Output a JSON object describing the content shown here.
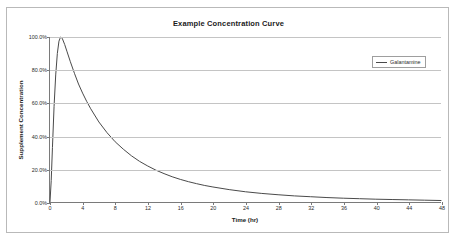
{
  "chart_data": {
    "type": "line",
    "title": "Example Concentration Curve",
    "xlabel": "Time (hr)",
    "ylabel": "Supplement Concentration",
    "xlim": [
      0,
      48
    ],
    "ylim": [
      0,
      100
    ],
    "grid": true,
    "legend_position": "upper-right-inside",
    "x_ticks": [
      0,
      4,
      8,
      12,
      16,
      20,
      24,
      28,
      32,
      36,
      40,
      44,
      48
    ],
    "x_tick_labels": [
      "0",
      "4",
      "8",
      "12",
      "16",
      "20",
      "24",
      "28",
      "32",
      "36",
      "40",
      "44",
      "48"
    ],
    "y_ticks": [
      0,
      20,
      40,
      60,
      80,
      100
    ],
    "y_tick_labels": [
      "0.0%",
      "20.0%",
      "40.0%",
      "60.0%",
      "80.0%",
      "100.0%"
    ],
    "series": [
      {
        "name": "Galantamine",
        "color": "#4a4a4a",
        "x": [
          0,
          0.15,
          0.3,
          0.5,
          0.7,
          0.9,
          1.1,
          1.3,
          1.5,
          1.8,
          2.1,
          2.5,
          3,
          3.5,
          4,
          4.5,
          5,
          6,
          7,
          8,
          9,
          10,
          11,
          12,
          13,
          14,
          15,
          16,
          17,
          18,
          19,
          20,
          22,
          24,
          26,
          28,
          30,
          32,
          34,
          36,
          38,
          40,
          42,
          44,
          46,
          48
        ],
        "y": [
          0,
          13,
          33,
          58,
          77,
          90,
          97.5,
          100,
          99.2,
          95.5,
          91,
          85,
          78,
          71.5,
          66,
          61,
          56.5,
          48.5,
          42,
          36.5,
          32,
          28,
          24.6,
          21.8,
          19.3,
          17.2,
          15.3,
          13.7,
          12.3,
          11.1,
          10,
          9.1,
          7.5,
          6.2,
          5.2,
          4.4,
          3.7,
          3.2,
          2.7,
          2.3,
          2,
          1.7,
          1.5,
          1.3,
          1.1,
          0.9
        ]
      }
    ]
  },
  "legend": {
    "entries": [
      {
        "label": "Galantamine"
      }
    ]
  }
}
